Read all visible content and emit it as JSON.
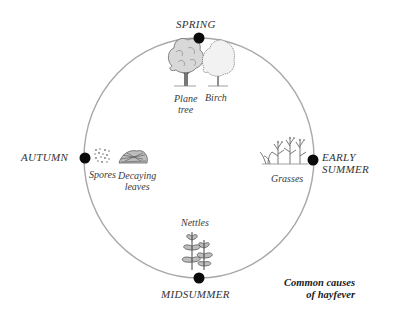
{
  "diagram": {
    "type": "seasonal-cycle",
    "circle": {
      "cx": 199,
      "cy": 158,
      "rx": 115,
      "ry": 120,
      "stroke": "#a8a8a8"
    },
    "dot_color": "#0a0a0a",
    "seasons": [
      {
        "id": "spring",
        "label": "SPRING",
        "position": "top"
      },
      {
        "id": "early-summer",
        "label_line1": "EARLY",
        "label_line2": "SUMMER",
        "position": "right"
      },
      {
        "id": "midsummer",
        "label": "MIDSUMMER",
        "position": "bottom"
      },
      {
        "id": "autumn",
        "label": "AUTUMN",
        "position": "left"
      }
    ],
    "causes": {
      "spring": [
        {
          "label_line1": "Plane",
          "label_line2": "tree",
          "icon": "plane-tree-icon"
        },
        {
          "label": "Birch",
          "icon": "birch-tree-icon"
        }
      ],
      "early_summer": [
        {
          "label": "Grasses",
          "icon": "grasses-icon"
        }
      ],
      "midsummer": [
        {
          "label": "Nettles",
          "icon": "nettles-icon"
        }
      ],
      "autumn": [
        {
          "label": "Spores",
          "icon": "spores-icon"
        },
        {
          "label_line1": "Decaying",
          "label_line2": "leaves",
          "icon": "decaying-leaves-icon"
        }
      ]
    },
    "caption": {
      "line1": "Common causes",
      "line2": "of hayfever"
    }
  }
}
